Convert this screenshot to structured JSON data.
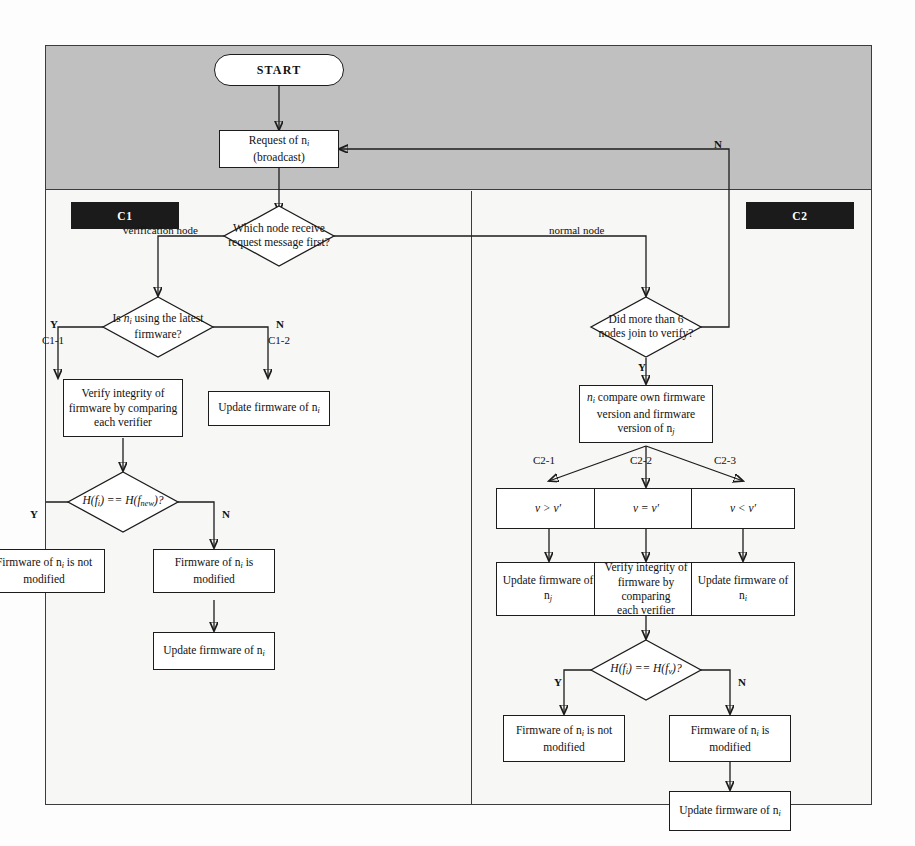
{
  "figure": {
    "type": "flowchart",
    "bands": {
      "top_band_color": "#c0c0c0",
      "body_color": "#f7f7f5"
    }
  },
  "tags": {
    "c1": "C1",
    "c2": "C2"
  },
  "nodes": {
    "start": "START",
    "request": "Request of nᵢ\n(broadcast)",
    "request_line1": "Request of n",
    "request_sub1": "i",
    "request_line2": "(broadcast)",
    "which_node": "Which node receive request message first?",
    "which_node_l1": "Which node receive",
    "which_node_l2": "request message first?",
    "is_latest": "Is nᵢ using the latest firmware?",
    "is_latest_l1_a": "Is ",
    "is_latest_l1_n": "n",
    "is_latest_l1_sub": "i",
    "is_latest_l1_b": " using the latest",
    "is_latest_l2": "firmware?",
    "verify_integrity_left_l1": "Verify integrity of",
    "verify_integrity_left_l2": "firmware by comparing",
    "verify_integrity_left_l3": "each verifier",
    "update_fw_ni_c12": "Update firmware of n",
    "update_fw_ni_c12_sub": "i",
    "hash_left": "H(fᵢ) == H(fₙₑₗ)?",
    "hash_left_a": "H(f",
    "hash_left_sub1": "i",
    "hash_left_b": ") == H(f",
    "hash_left_sub2": "new",
    "hash_left_c": ")?",
    "fw_not_modified_left_l1": "Firmware of n",
    "fw_not_modified_left_sub": "i",
    "fw_not_modified_left_l1b": " is not",
    "fw_not_modified_left_l2": "modified",
    "fw_modified_left": "Firmware of n",
    "fw_modified_left_sub": "i",
    "fw_modified_left_b": " is modified",
    "update_fw_left_bottom": "Update firmware of n",
    "update_fw_left_bottom_sub": "i",
    "more_than_6": "Did more than 6 nodes join to verify?",
    "more_than_6_l1": "Did more than 6",
    "more_than_6_l2": "nodes join to verify?",
    "compare_versions_l1a": "n",
    "compare_versions_l1sub": "i",
    "compare_versions_l1b": " compare own firmware",
    "compare_versions_l2": "version and firmware",
    "compare_versions_l3a": "version of n",
    "compare_versions_l3sub": "j",
    "v_greater": "v > v′",
    "v_equal": "v = v′",
    "v_less": "v < v′",
    "update_fw_nj": "Update firmware of n",
    "update_fw_nj_sub": "j",
    "verify_integrity_right_l1": "Verify integrity of",
    "verify_integrity_right_l2": "firmware by comparing",
    "verify_integrity_right_l3": "each verifier",
    "update_fw_ni_right": "Update firmware of n",
    "update_fw_ni_right_sub": "i",
    "hash_right_a": "H(f",
    "hash_right_sub1": "i",
    "hash_right_b": ") == H(f",
    "hash_right_sub2": "v",
    "hash_right_c": ")?",
    "fw_not_modified_right_l1": "Firmware of n",
    "fw_not_modified_right_sub": "i",
    "fw_not_modified_right_l1b": " is not",
    "fw_not_modified_right_l2": "modified",
    "fw_modified_right": "Firmware of n",
    "fw_modified_right_sub": "i",
    "fw_modified_right_b": " is modified",
    "update_fw_right_bottom": "Update firmware of n",
    "update_fw_right_bottom_sub": "i"
  },
  "edge_labels": {
    "loop_n": "N",
    "verification_node": "verification node",
    "normal_node": "normal node",
    "c1_y": "Y",
    "c1_1": "C1-1",
    "c1_n": "N",
    "c1_2": "C1-2",
    "left_hash_y": "Y",
    "left_hash_n": "N",
    "more6_y": "Y",
    "c2_1": "C2-1",
    "c2_2": "C2-2",
    "c2_3": "C2-3",
    "right_hash_y": "Y",
    "right_hash_n": "N"
  }
}
